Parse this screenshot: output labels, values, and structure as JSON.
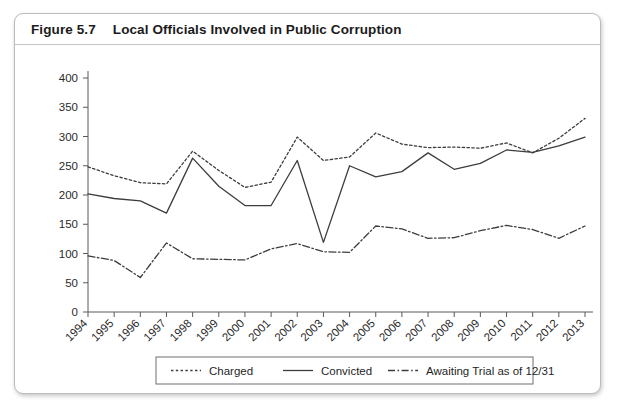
{
  "figure": {
    "label": "Figure 5.7",
    "title": "Local Officials Involved in Public Corruption"
  },
  "chart_data": {
    "type": "line",
    "title": "Local Officials Involved in Public Corruption",
    "xlabel": "",
    "ylabel": "",
    "ylim": [
      0,
      400
    ],
    "ytick_step": 50,
    "yticks": [
      0,
      50,
      100,
      150,
      200,
      250,
      300,
      350,
      400
    ],
    "grid": false,
    "legend_position": "bottom",
    "categories": [
      "1994",
      "1995",
      "1996",
      "1997",
      "1998",
      "1999",
      "2000",
      "2001",
      "2002",
      "2003",
      "2004",
      "2005",
      "2006",
      "2007",
      "2008",
      "2009",
      "2010",
      "2011",
      "2012",
      "2013"
    ],
    "series": [
      {
        "name": "Charged",
        "style": "dotted",
        "color": "#3d3d3d",
        "values": [
          248,
          233,
          221,
          219,
          275,
          242,
          213,
          222,
          299,
          259,
          265,
          306,
          287,
          281,
          282,
          280,
          289,
          272,
          297,
          331
        ]
      },
      {
        "name": "Convicted",
        "style": "solid",
        "color": "#3d3d3d",
        "values": [
          202,
          194,
          190,
          169,
          263,
          215,
          182,
          182,
          259,
          119,
          250,
          231,
          240,
          272,
          244,
          254,
          277,
          273,
          284,
          299
        ]
      },
      {
        "name": "Awaiting Trial as of 12/31",
        "style": "dashdot",
        "color": "#3d3d3d",
        "values": [
          96,
          88,
          59,
          118,
          91,
          90,
          89,
          108,
          117,
          103,
          102,
          147,
          142,
          126,
          127,
          139,
          148,
          141,
          126,
          147
        ]
      }
    ]
  },
  "legend": {
    "items": [
      {
        "label": "Charged",
        "style": "dotted"
      },
      {
        "label": "Convicted",
        "style": "solid"
      },
      {
        "label": "Awaiting Trial as of 12/31",
        "style": "dashdot"
      }
    ]
  }
}
